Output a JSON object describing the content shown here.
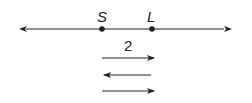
{
  "diagram": {
    "type": "number-line",
    "line_color": "#222222",
    "points": [
      {
        "label": "S",
        "x": 102
      },
      {
        "label": "L",
        "x": 152
      }
    ],
    "segment_label": "2",
    "direction_arrows": [
      {
        "direction": "right"
      },
      {
        "direction": "left"
      },
      {
        "direction": "right"
      }
    ]
  }
}
